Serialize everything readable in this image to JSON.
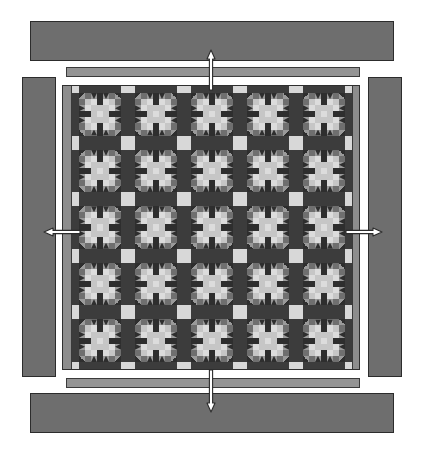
{
  "diagram": {
    "type": "quilt-assembly-diagram",
    "grid_rows": 5,
    "grid_columns": 5,
    "total_blocks": 25,
    "block_name": "star-block",
    "sashing": "present",
    "cornerstones": "present",
    "borders": {
      "inner_border_label": "inner border",
      "outer_border_label": "outer border",
      "inner_border_count": 4,
      "outer_border_count": 4
    },
    "arrows": {
      "count": 4,
      "directions": [
        "top",
        "bottom",
        "left",
        "right"
      ],
      "meaning": "border attachment direction"
    }
  },
  "colors": {
    "background": "#ffffff",
    "outer_border": "#6e6e6e",
    "outer_border_outline": "#2c2c2c",
    "inner_border": "#949494",
    "inner_border_outline": "#3a3a3a",
    "sashing": "#3c3c3c",
    "cornerstone": "#d8d8d8",
    "block_background": "#8f8f8f",
    "tone_dark": "#2e2e2e",
    "tone_mid": "#6f6f6f",
    "tone_mid_light": "#9a9a9a",
    "tone_light": "#c6c6c6",
    "tone_extra_light": "#dcdcdc",
    "arrow_fill": "#ffffff",
    "arrow_outline": "#2b2b2b"
  },
  "pieces": {
    "outer_borders": [
      {
        "name": "outer-border-top",
        "x": 30,
        "y": 21,
        "w": 364,
        "h": 40
      },
      {
        "name": "outer-border-bottom",
        "x": 30,
        "y": 393,
        "w": 364,
        "h": 40
      },
      {
        "name": "outer-border-left",
        "x": 22,
        "y": 77,
        "w": 34,
        "h": 300
      },
      {
        "name": "outer-border-right",
        "x": 368,
        "y": 77,
        "w": 34,
        "h": 300
      }
    ],
    "inner_borders": [
      {
        "name": "inner-border-top",
        "x": 66,
        "y": 67,
        "w": 294,
        "h": 10
      },
      {
        "name": "inner-border-bottom",
        "x": 66,
        "y": 378,
        "w": 294,
        "h": 10
      },
      {
        "name": "inner-border-left",
        "x": 62,
        "y": 85,
        "w": 9,
        "h": 285
      },
      {
        "name": "inner-border-right",
        "x": 353,
        "y": 85,
        "w": 7,
        "h": 285
      }
    ],
    "arrows": [
      {
        "name": "arrow-top",
        "x": 204,
        "y": 50,
        "w": 14,
        "h": 42,
        "orientation": "vertical"
      },
      {
        "name": "arrow-bottom",
        "x": 204,
        "y": 368,
        "w": 14,
        "h": 44,
        "orientation": "vertical"
      },
      {
        "name": "arrow-left",
        "x": 44,
        "y": 225,
        "w": 38,
        "h": 14,
        "orientation": "horizontal"
      },
      {
        "name": "arrow-right",
        "x": 344,
        "y": 225,
        "w": 38,
        "h": 14,
        "orientation": "horizontal"
      }
    ]
  }
}
